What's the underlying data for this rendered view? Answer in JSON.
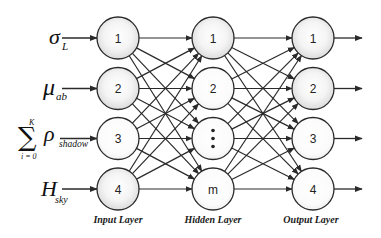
{
  "diagram": {
    "type": "neural-network",
    "colors": {
      "stroke": "#2a2a2a",
      "node_fill_center": "#ffffff",
      "node_fill_edge": "#d9d9d9",
      "background": "#ffffff"
    },
    "inputs": [
      {
        "symbol": "σ",
        "subscript": "L",
        "row": 0
      },
      {
        "symbol": "μ",
        "subscript": "ab",
        "row": 1
      },
      {
        "symbol": "ρ",
        "subscript": "shadow",
        "row": 2,
        "summation": {
          "symbol": "∑",
          "upper": "K",
          "lower": "i = 0"
        }
      },
      {
        "symbol": "H",
        "subscript": "sky",
        "row": 3
      }
    ],
    "layers": [
      {
        "name": "Input Layer",
        "nodes": [
          "1",
          "2",
          "3",
          "4"
        ]
      },
      {
        "name": "Hidden Layer",
        "nodes": [
          "1",
          "2",
          "⋮",
          "m"
        ]
      },
      {
        "name": "Output Layer",
        "nodes": [
          "1",
          "2",
          "3",
          "4"
        ]
      }
    ],
    "connections": "fully-connected between adjacent layers, arrows pointing right",
    "outputs_arrows": 4
  }
}
